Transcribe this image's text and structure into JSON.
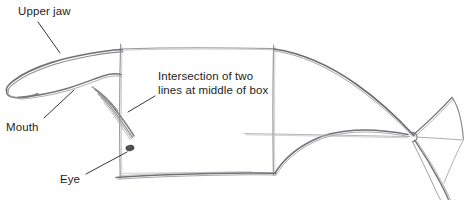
{
  "image": {
    "kind": "pencil-sketch",
    "subject": "fish construction drawing",
    "width": 464,
    "height": 200,
    "background_color": "#ffffff",
    "pencil_color": "#6f6f71",
    "pencil_color_dark": "#4a4a4c",
    "pencil_color_light": "#a9a9ad",
    "text_color": "#1d1d1d"
  },
  "annotations": [
    {
      "id": "upper-jaw",
      "label": "Upper jaw",
      "text_x": 18,
      "text_y": 6,
      "leader": {
        "x1": 38,
        "y1": 22,
        "x2": 60,
        "y2": 53
      }
    },
    {
      "id": "intersection",
      "label": "Intersection of two\nlines at middle of box",
      "text_x": 158,
      "text_y": 71,
      "leader": {
        "x1": 155,
        "y1": 96,
        "x2": 128,
        "y2": 112
      }
    },
    {
      "id": "mouth",
      "label": "Mouth",
      "text_x": 6,
      "text_y": 121,
      "leader": {
        "x1": 44,
        "y1": 118,
        "x2": 74,
        "y2": 90
      }
    },
    {
      "id": "eye",
      "label": "Eye",
      "text_x": 60,
      "text_y": 173,
      "leader": {
        "x1": 86,
        "y1": 174,
        "x2": 127,
        "y2": 152
      }
    }
  ],
  "construction_box": {
    "left": 120,
    "top": 48,
    "right": 274,
    "bottom": 173,
    "stroke": "#8d8d92"
  },
  "features": {
    "eye_center_x": 130,
    "eye_center_y": 148,
    "eye_rx": 4.2,
    "eye_ry": 2.8,
    "eye_color": "#4f4d50"
  }
}
